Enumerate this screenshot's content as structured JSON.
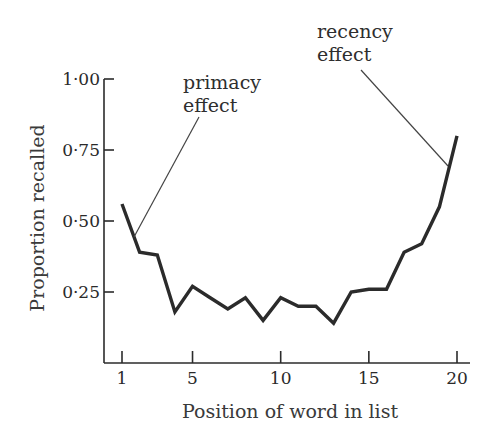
{
  "chart_data": {
    "type": "line",
    "title": "",
    "xlabel": "Position of word in list",
    "ylabel": "Proportion recalled",
    "x": [
      1,
      2,
      3,
      4,
      5,
      6,
      7,
      8,
      9,
      10,
      11,
      12,
      13,
      14,
      15,
      16,
      17,
      18,
      19,
      20
    ],
    "series": [
      {
        "name": "Proportion recalled",
        "values": [
          0.56,
          0.39,
          0.38,
          0.18,
          0.27,
          0.23,
          0.19,
          0.23,
          0.15,
          0.23,
          0.2,
          0.2,
          0.14,
          0.25,
          0.26,
          0.26,
          0.39,
          0.42,
          0.55,
          0.8
        ]
      }
    ],
    "xticks": [
      "1",
      "5",
      "10",
      "15",
      "20"
    ],
    "xtick_values": [
      1,
      5,
      10,
      15,
      20
    ],
    "yticks": [
      "0·25",
      "0·50",
      "0·75",
      "1·00"
    ],
    "ytick_values": [
      0.25,
      0.5,
      0.75,
      1.0
    ],
    "xlim": [
      0,
      21
    ],
    "ylim": [
      0,
      1.0
    ],
    "grid": false,
    "legend": null,
    "annotations": [
      {
        "lines": [
          "primacy",
          "effect"
        ],
        "points_to_x": 1.5
      },
      {
        "lines": [
          "recency",
          "effect"
        ],
        "points_to_x": 19.5
      }
    ]
  },
  "axes": {
    "x_title": "Position of word in list",
    "y_title": "Proportion recalled"
  },
  "annotations": {
    "primacy_line1": "primacy",
    "primacy_line2": "effect",
    "recency_line1": "recency",
    "recency_line2": "effect"
  },
  "style": {
    "line_color": "#2b2b2b",
    "axis_color": "#2b2b2b",
    "background": "#ffffff"
  }
}
